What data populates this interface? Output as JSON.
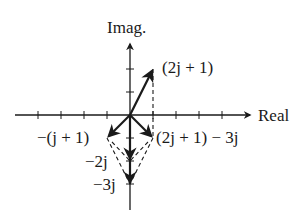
{
  "diagram": {
    "axes": {
      "real_label": "Real",
      "imag_label": "Imag."
    },
    "vectors": [
      {
        "label": "(2j + 1)",
        "re": 1,
        "im": 2,
        "style": "solid"
      },
      {
        "label": "−(j + 1)",
        "re": -1,
        "im": -1,
        "style": "solid"
      },
      {
        "label": "(2j + 1) − 3j",
        "re": 1,
        "im": -1,
        "style": "solid"
      },
      {
        "label": "−2j",
        "re": 0,
        "im": -2,
        "style": "solid"
      },
      {
        "label": "−3j",
        "re": 0,
        "im": -3,
        "style": "solid"
      }
    ],
    "labels": {
      "v1": "(2j + 1)",
      "v2": "−(j + 1)",
      "v3": "(2j + 1) − 3j",
      "v4": "−2j",
      "v5": "−3j"
    },
    "colors": {
      "ink": "#1a1a1a",
      "background": "#ffffff"
    }
  }
}
